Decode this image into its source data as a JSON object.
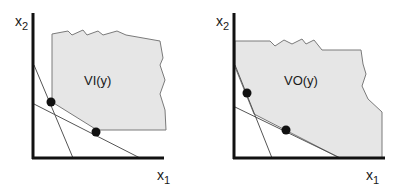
{
  "panels": [
    {
      "id": "left",
      "region_label": "VI(y)",
      "x_axis_label": "x",
      "x_axis_subscript": "1",
      "y_axis_label": "x",
      "y_axis_subscript": "2",
      "points_count": 2
    },
    {
      "id": "right",
      "region_label": "VO(y)",
      "x_axis_label": "x",
      "x_axis_subscript": "1",
      "y_axis_label": "x",
      "y_axis_subscript": "2",
      "points_count": 2
    }
  ],
  "colors": {
    "region_fill": "#e6e6e6",
    "region_stroke": "#7a7a7a",
    "axis": "#111111",
    "line": "#555555",
    "point": "#111111"
  }
}
